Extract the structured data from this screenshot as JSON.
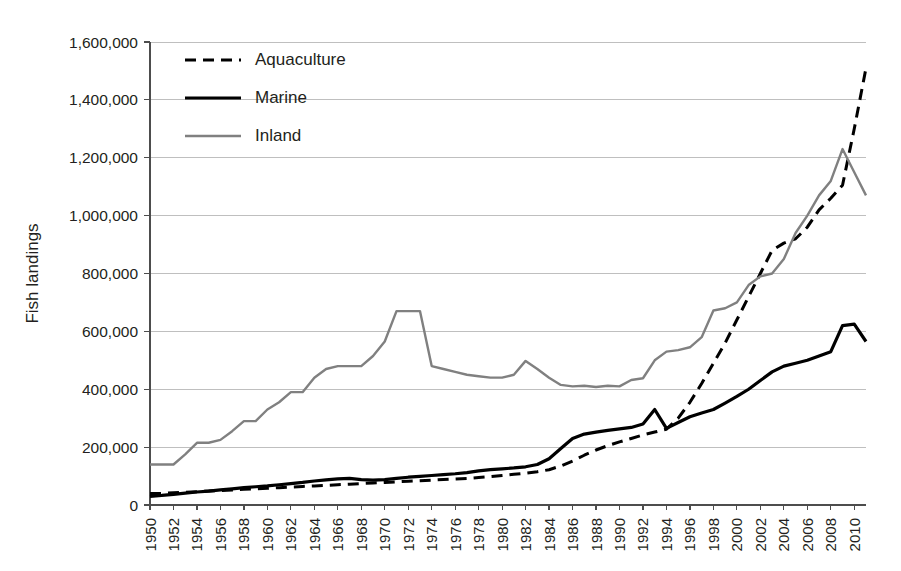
{
  "chart_data": {
    "type": "line",
    "title": "",
    "xlabel": "",
    "ylabel": "Fish landings",
    "xlim": [
      1950,
      2011
    ],
    "ylim": [
      0,
      1600000
    ],
    "ytick_step": 200000,
    "grid": true,
    "legend_position": "top-left",
    "ytick_labels": [
      "0",
      "200,000",
      "400,000",
      "600,000",
      "800,000",
      "1,000,000",
      "1,200,000",
      "1,400,000",
      "1,600,000"
    ],
    "ytick_values": [
      0,
      200000,
      400000,
      600000,
      800000,
      1000000,
      1200000,
      1400000,
      1600000
    ],
    "xtick_labels": [
      "1950",
      "1952",
      "1954",
      "1956",
      "1958",
      "1960",
      "1962",
      "1964",
      "1966",
      "1968",
      "1970",
      "1972",
      "1974",
      "1976",
      "1978",
      "1980",
      "1982",
      "1984",
      "1986",
      "1988",
      "1990",
      "1992",
      "1994",
      "1996",
      "1998",
      "2000",
      "2002",
      "2004",
      "2006",
      "2008",
      "2010"
    ],
    "xtick_values": [
      1950,
      1952,
      1954,
      1956,
      1958,
      1960,
      1962,
      1964,
      1966,
      1968,
      1970,
      1972,
      1974,
      1976,
      1978,
      1980,
      1982,
      1984,
      1986,
      1988,
      1990,
      1992,
      1994,
      1996,
      1998,
      2000,
      2002,
      2004,
      2006,
      2008,
      2010
    ],
    "x": [
      1950,
      1951,
      1952,
      1953,
      1954,
      1955,
      1956,
      1957,
      1958,
      1959,
      1960,
      1961,
      1962,
      1963,
      1964,
      1965,
      1966,
      1967,
      1968,
      1969,
      1970,
      1971,
      1972,
      1973,
      1974,
      1975,
      1976,
      1977,
      1978,
      1979,
      1980,
      1981,
      1982,
      1983,
      1984,
      1985,
      1986,
      1987,
      1988,
      1989,
      1990,
      1991,
      1992,
      1993,
      1994,
      1995,
      1996,
      1997,
      1998,
      1999,
      2000,
      2001,
      2002,
      2003,
      2004,
      2005,
      2006,
      2007,
      2008,
      2009,
      2010,
      2011
    ],
    "series": [
      {
        "name": "Aquaculture",
        "color": "#000000",
        "style": "dashed",
        "width": 3.0,
        "values": [
          40000,
          40000,
          42000,
          44000,
          46000,
          48000,
          50000,
          52000,
          54000,
          56000,
          58000,
          60000,
          62000,
          64000,
          66000,
          68000,
          70000,
          72000,
          74000,
          76000,
          78000,
          80000,
          82000,
          84000,
          86000,
          88000,
          90000,
          92000,
          95000,
          98000,
          102000,
          106000,
          110000,
          115000,
          122000,
          135000,
          152000,
          172000,
          190000,
          205000,
          218000,
          230000,
          242000,
          252000,
          262000,
          300000,
          355000,
          420000,
          490000,
          560000,
          640000,
          720000,
          800000,
          880000,
          905000,
          920000,
          960000,
          1020000,
          1060000,
          1105000,
          1300000,
          1510000
        ]
      },
      {
        "name": "Marine",
        "color": "#000000",
        "style": "solid",
        "width": 3.2,
        "values": [
          30000,
          33000,
          37000,
          41000,
          45000,
          48000,
          52000,
          56000,
          60000,
          63000,
          66000,
          70000,
          74000,
          78000,
          83000,
          87000,
          90000,
          92000,
          88000,
          86000,
          88000,
          92000,
          96000,
          99000,
          102000,
          105000,
          108000,
          112000,
          118000,
          122000,
          125000,
          128000,
          132000,
          140000,
          160000,
          195000,
          230000,
          245000,
          252000,
          258000,
          263000,
          268000,
          280000,
          330000,
          265000,
          285000,
          305000,
          318000,
          330000,
          352000,
          375000,
          400000,
          430000,
          460000,
          480000,
          490000,
          500000,
          515000,
          530000,
          620000,
          625000,
          565000
        ]
      },
      {
        "name": "Inland",
        "color": "#808080",
        "style": "solid",
        "width": 2.4,
        "values": [
          140000,
          140000,
          140000,
          175000,
          215000,
          215000,
          225000,
          255000,
          290000,
          290000,
          330000,
          355000,
          390000,
          390000,
          440000,
          470000,
          480000,
          480000,
          480000,
          515000,
          565000,
          670000,
          670000,
          670000,
          480000,
          470000,
          460000,
          450000,
          445000,
          440000,
          440000,
          450000,
          498000,
          470000,
          440000,
          415000,
          410000,
          412000,
          408000,
          412000,
          410000,
          432000,
          438000,
          500000,
          530000,
          535000,
          545000,
          580000,
          672000,
          680000,
          700000,
          760000,
          790000,
          800000,
          850000,
          940000,
          1000000,
          1070000,
          1120000,
          1230000,
          1150000,
          1070000
        ]
      }
    ],
    "legend_entries": [
      {
        "label": "Aquaculture",
        "color": "#000000",
        "style": "dashed"
      },
      {
        "label": "Marine",
        "color": "#000000",
        "style": "solid"
      },
      {
        "label": "Inland",
        "color": "#808080",
        "style": "solid"
      }
    ]
  }
}
